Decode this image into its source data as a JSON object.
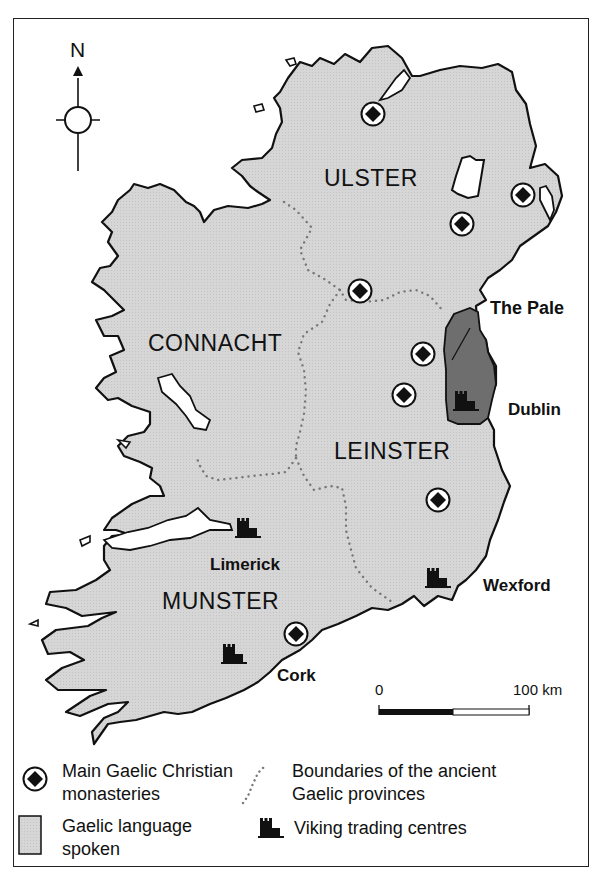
{
  "map": {
    "compass": {
      "label": "N",
      "icon": "north-arrow-icon"
    },
    "provinces": [
      {
        "name": "ULSTER",
        "x": 324,
        "y": 165
      },
      {
        "name": "CONNACHT",
        "x": 148,
        "y": 330
      },
      {
        "name": "LEINSTER",
        "x": 334,
        "y": 438
      },
      {
        "name": "MUNSTER",
        "x": 162,
        "y": 588
      }
    ],
    "regions": [
      {
        "name": "The Pale",
        "x": 480,
        "y": 297
      }
    ],
    "viking_centres": [
      {
        "name": "Dublin",
        "x": 507,
        "y": 400
      },
      {
        "name": "Limerick",
        "x": 210,
        "y": 555
      },
      {
        "name": "Wexford",
        "x": 483,
        "y": 578
      },
      {
        "name": "Cork",
        "x": 276,
        "y": 666
      }
    ],
    "scale": {
      "start": "0",
      "end": "100 km"
    },
    "colors": {
      "land": "#d4d4d4",
      "pale": "#6e6e6e",
      "ink": "#111111"
    }
  },
  "legend": {
    "monasteries": "Main Gaelic Christian monasteries",
    "monasteries_l1": "Main Gaelic Christian",
    "monasteries_l2": "monasteries",
    "boundaries_l1": "Boundaries of the ancient",
    "boundaries_l2": "Gaelic provinces",
    "language_l1": "Gaelic language",
    "language_l2": "spoken",
    "viking": "Viking trading centres"
  }
}
